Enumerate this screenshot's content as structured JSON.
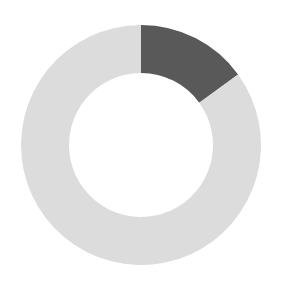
{
  "canvas": {
    "width": 283,
    "height": 291,
    "background_color": "#ffffff"
  },
  "chart_data": {
    "type": "pie",
    "variant": "donut",
    "title": "",
    "subtitle": "",
    "xlabel": "",
    "ylabel": "",
    "legend": {
      "visible": false,
      "position": "none",
      "entries": []
    },
    "grid": false,
    "data_labels_visible": false,
    "annotations": [],
    "tick_labels": [],
    "start_angle_deg": 0,
    "direction": "clockwise",
    "center_x": 141,
    "center_y": 145,
    "outer_radius": 120,
    "inner_radius": 72,
    "ring_thickness": 48,
    "hole_color": "#ffffff",
    "total": 100,
    "categories": [
      "Highlighted",
      "Remaining"
    ],
    "values": [
      15,
      85
    ],
    "colors": [
      "#595959",
      "#dcdcdc"
    ],
    "slices": [
      {
        "name": "Highlighted",
        "value": 15,
        "percent": 15,
        "color": "#595959",
        "start_angle_deg": 0,
        "end_angle_deg": 54
      },
      {
        "name": "Remaining",
        "value": 85,
        "percent": 85,
        "color": "#dcdcdc",
        "start_angle_deg": 54,
        "end_angle_deg": 360
      }
    ]
  }
}
